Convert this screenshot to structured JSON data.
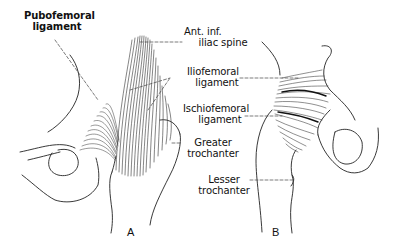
{
  "diagram": {
    "labels": {
      "pubofemoral": {
        "line1": "Pubofemoral",
        "line2": "ligament"
      },
      "ant_inf_iliac_spine": {
        "line1": "Ant. inf.",
        "line2": "iliac spine"
      },
      "iliofemoral": {
        "line1": "Iliofemoral",
        "line2": "ligament"
      },
      "ischiofemoral": {
        "line1": "Ischiofemoral",
        "line2": "ligament"
      },
      "greater_trochanter": {
        "line1": "Greater",
        "line2": "trochanter"
      },
      "lesser_trochanter": {
        "line1": "Lesser",
        "line2": "trochanter"
      }
    },
    "figures": {
      "a": "A",
      "b": "B"
    },
    "colors": {
      "ink": "#111111",
      "background": "#ffffff"
    }
  }
}
